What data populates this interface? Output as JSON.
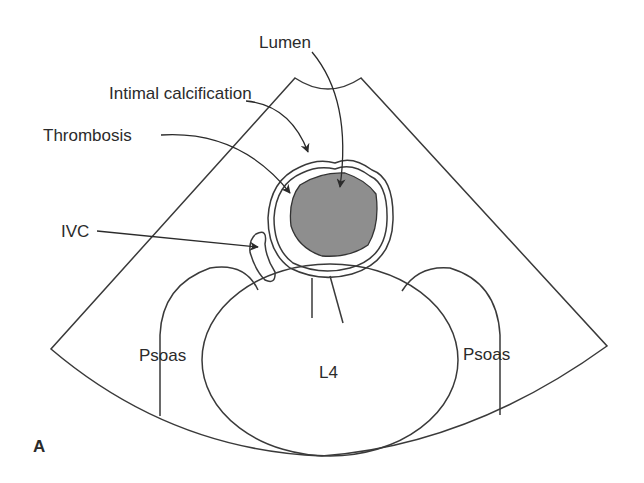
{
  "figure": {
    "panel_label": "A",
    "labels": {
      "lumen": "Lumen",
      "intimal_calcification": "Intimal calcification",
      "thrombosis": "Thrombosis",
      "ivc": "IVC",
      "psoas_left": "Psoas",
      "psoas_right": "Psoas",
      "vertebra": "L4"
    },
    "colors": {
      "line": "#3a3a3a",
      "lumen_fill": "#8e8e8e",
      "background": "#ffffff",
      "text": "#2b2b2b"
    }
  }
}
